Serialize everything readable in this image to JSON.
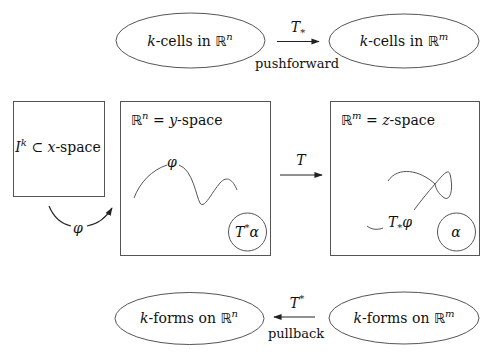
{
  "diagram": {
    "colors": {
      "stroke": "#555555",
      "text": "#111111",
      "background": "#ffffff"
    },
    "top_row": {
      "left_ellipse": {
        "prefix": "k",
        "text": "-cells in ",
        "space": "ℝ",
        "exp": "n"
      },
      "right_ellipse": {
        "prefix": "k",
        "text": "-cells in ",
        "space": "ℝ",
        "exp": "m"
      },
      "arrow": {
        "symbol": "T",
        "subscript": "*",
        "caption": "pushforward",
        "direction": "right"
      }
    },
    "middle_row": {
      "param_box": {
        "base": "I",
        "exp": "k",
        "rel": " ⊂ ",
        "var": "x",
        "suffix": "-space"
      },
      "param_arrow": {
        "symbol": "φ"
      },
      "domain_box": {
        "space": "ℝ",
        "exp": "n",
        "eq": " = ",
        "var": "y",
        "suffix": "-space",
        "curve_label": "φ",
        "form_circle": {
          "symbol": "T",
          "sup": "*",
          "form": "α"
        }
      },
      "map_arrow": {
        "symbol": "T",
        "direction": "right"
      },
      "target_box": {
        "space": "ℝ",
        "exp": "m",
        "eq": " = ",
        "var": "z",
        "suffix": "-space",
        "curve_label": {
          "symbol": "T",
          "subscript": "*",
          "map": "φ"
        },
        "form_circle": {
          "form": "α"
        }
      }
    },
    "bottom_row": {
      "left_ellipse": {
        "prefix": "k",
        "text": "-forms on ",
        "space": "ℝ",
        "exp": "n"
      },
      "right_ellipse": {
        "prefix": "k",
        "text": "-forms on ",
        "space": "ℝ",
        "exp": "m"
      },
      "arrow": {
        "symbol": "T",
        "superscript": "*",
        "caption": "pullback",
        "direction": "left"
      }
    }
  }
}
